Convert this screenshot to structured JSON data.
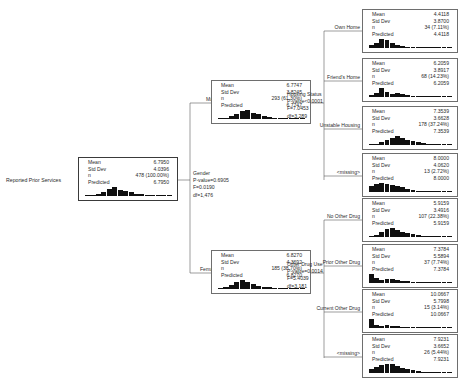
{
  "diagram": {
    "type": "decision-tree",
    "target_label": "Reported Prior Services",
    "stat_keys": {
      "mean": "Mean",
      "std_dev": "Std Dev",
      "n": "n",
      "predicted": "Predicted"
    },
    "nodes": {
      "root": {
        "name": "root-node",
        "mean": "6.7950",
        "std_dev": "4.0396",
        "n": "478 (100.00%)",
        "predicted": "6.7950",
        "histogram": [
          4,
          10,
          26,
          44,
          78,
          100,
          72,
          54,
          40,
          26,
          18,
          12,
          8,
          5,
          3,
          2
        ]
      },
      "male": {
        "name": "node-male",
        "mean": "6.7747",
        "std_dev": "3.8245",
        "n": "293 (61.30%)",
        "predicted": "6.7747",
        "histogram": [
          5,
          12,
          30,
          52,
          86,
          100,
          70,
          50,
          34,
          22,
          14,
          9,
          6,
          4,
          2,
          1
        ]
      },
      "female": {
        "name": "node-female",
        "mean": "6.8270",
        "std_dev": "4.3692",
        "n": "185 (38.70%)",
        "predicted": "6.8270",
        "histogram": [
          8,
          22,
          48,
          80,
          100,
          74,
          56,
          38,
          26,
          18,
          12,
          8,
          5,
          3,
          2,
          1
        ]
      },
      "own_home": {
        "name": "node-own-home",
        "mean": "4.4118",
        "std_dev": "3.8700",
        "n": "34 (7.11%)",
        "predicted": "4.4118",
        "histogram": [
          30,
          58,
          100,
          84,
          52,
          34,
          22,
          14,
          9,
          6,
          4,
          3,
          2,
          1,
          1,
          1
        ]
      },
      "friends_home": {
        "name": "node-friends-home",
        "mean": "6.2059",
        "std_dev": "3.8917",
        "n": "68 (14.23%)",
        "predicted": "6.2059",
        "histogram": [
          22,
          40,
          100,
          56,
          34,
          46,
          30,
          20,
          14,
          10,
          7,
          5,
          3,
          2,
          1,
          1
        ]
      },
      "unstable_housing": {
        "name": "node-unstable-housing",
        "mean": "7.3539",
        "std_dev": "3.6628",
        "n": "178 (37.24%)",
        "predicted": "7.3539",
        "histogram": [
          6,
          14,
          34,
          56,
          82,
          100,
          76,
          58,
          40,
          28,
          18,
          12,
          8,
          5,
          3,
          2
        ]
      },
      "housing_missing": {
        "name": "node-housing-missing",
        "mean": "8.0000",
        "std_dev": "4.0620",
        "n": "13 (2.72%)",
        "predicted": "8.0000",
        "histogram": [
          70,
          88,
          100,
          92,
          80,
          64,
          50,
          36,
          24,
          16,
          10,
          6,
          4,
          2,
          1,
          1
        ]
      },
      "no_other_drug": {
        "name": "node-no-other-drug",
        "mean": "5.9159",
        "std_dev": "3.4916",
        "n": "107 (22.38%)",
        "predicted": "5.9159",
        "histogram": [
          10,
          26,
          52,
          84,
          100,
          78,
          58,
          42,
          28,
          18,
          12,
          8,
          5,
          3,
          2,
          1
        ]
      },
      "prior_other_drug": {
        "name": "node-prior-other-drug",
        "mean": "7.3784",
        "std_dev": "5.5894",
        "n": "37 (7.74%)",
        "predicted": "7.3784",
        "histogram": [
          100,
          52,
          36,
          46,
          40,
          32,
          24,
          18,
          13,
          9,
          6,
          4,
          3,
          2,
          1,
          1
        ]
      },
      "current_other_drug": {
        "name": "node-current-other-drug",
        "mean": "10.0667",
        "std_dev": "5.7998",
        "n": "15 (3.14%)",
        "predicted": "10.0667",
        "histogram": [
          100,
          36,
          24,
          30,
          26,
          20,
          16,
          12,
          9,
          7,
          5,
          4,
          3,
          2,
          1,
          1
        ]
      },
      "drug_missing": {
        "name": "node-drug-missing",
        "mean": "7.9231",
        "std_dev": "3.6652",
        "n": "26 (5.44%)",
        "predicted": "7.9231",
        "histogram": [
          48,
          66,
          88,
          100,
          96,
          78,
          60,
          44,
          30,
          20,
          13,
          9,
          6,
          4,
          2,
          1
        ]
      }
    },
    "splits": {
      "gender": {
        "variable": "Gender",
        "p_value": "P-value=0.6905",
        "statistic": "F=0.0190",
        "df": "df=1,476"
      },
      "housing_status": {
        "variable": "Housing Status",
        "p_value": "P-value<0.0001",
        "statistic": "F=7.0453",
        "df": "df=3,289"
      },
      "other_drug_use": {
        "variable": "Other Drug Use",
        "p_value": "P-value=0.0014",
        "statistic": "F=5.4039",
        "df": "df=3,181"
      }
    },
    "branch_labels": {
      "male": "Male",
      "female": "Female",
      "own_home": "Own Home",
      "friends_home": "Friend's Home",
      "unstable_housing": "Unstable Housing",
      "housing_missing": "<missing>",
      "no_other_drug": "No Other Drug",
      "prior_other_drug": "Prior Other Drug",
      "current_other_drug": "Current Other Drug",
      "drug_missing": "<missing>"
    }
  }
}
